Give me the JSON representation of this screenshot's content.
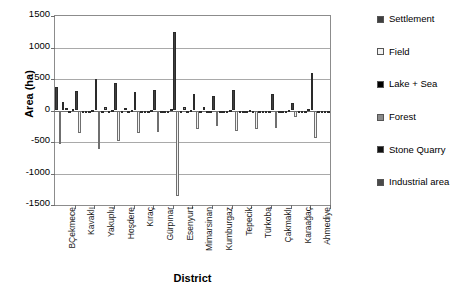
{
  "chart_data": {
    "type": "bar",
    "title": "",
    "xlabel": "District",
    "ylabel": "Area (ha)",
    "ylim": [
      -1500,
      1500
    ],
    "ytick_step": 500,
    "yticks": [
      1500,
      1000,
      500,
      0,
      -500,
      -1000,
      -1500
    ],
    "ytick_labels": [
      "1500",
      "1000",
      "500",
      "0",
      "-500",
      "-1000",
      "-1500"
    ],
    "grid": true,
    "legend_position": "right",
    "orientation": "vertical",
    "categories": [
      "BÇekmece",
      "Kavaklı",
      "Yakuplu",
      "Hoşdere",
      "Kıraç",
      "Gürpınar",
      "Esenyurt",
      "Mimarsinan",
      "Kumburgaz",
      "Tepecik",
      "Türkoba",
      "Çakmaklı",
      "Karaağaç",
      "Ahmediye"
    ],
    "series": [
      {
        "name": "Settlement",
        "color": "#3f3f3f",
        "values": [
          370,
          310,
          505,
          440,
          300,
          325,
          1240,
          260,
          230,
          330,
          0,
          265,
          120,
          600
        ]
      },
      {
        "name": "Field",
        "color": "#f2f2f2",
        "values": [
          -530,
          -350,
          -610,
          -490,
          -350,
          -335,
          -1350,
          -290,
          -245,
          -330,
          -300,
          -280,
          -110,
          -440
        ]
      },
      {
        "name": "Lake + Sea",
        "color": "#000000",
        "values": [
          130,
          0,
          0,
          0,
          0,
          0,
          0,
          0,
          0,
          0,
          0,
          0,
          0,
          0
        ]
      },
      {
        "name": "Forest",
        "color": "#8a8a8a",
        "values": [
          35,
          0,
          55,
          40,
          -40,
          0,
          55,
          60,
          0,
          0,
          0,
          0,
          0,
          0
        ]
      },
      {
        "name": "Stone Quarry",
        "color": "#111111",
        "values": [
          0,
          0,
          0,
          0,
          0,
          0,
          0,
          0,
          0,
          0,
          0,
          0,
          0,
          0
        ]
      },
      {
        "name": "Industrial area",
        "color": "#4a4a4a",
        "values": [
          20,
          15,
          10,
          15,
          10,
          20,
          10,
          0,
          15,
          10,
          0,
          15,
          30,
          0
        ]
      }
    ]
  },
  "legend": {
    "items": [
      {
        "label": "Settlement",
        "color": "#3f3f3f"
      },
      {
        "label": "Field",
        "color": "#f2f2f2"
      },
      {
        "label": "Lake + Sea",
        "color": "#000000"
      },
      {
        "label": "Forest",
        "color": "#8a8a8a"
      },
      {
        "label": "Stone Quarry",
        "color": "#111111"
      },
      {
        "label": "Industrial area",
        "color": "#4a4a4a"
      }
    ]
  },
  "axis": {
    "y_title": "Area (ha)",
    "x_title": "District"
  }
}
